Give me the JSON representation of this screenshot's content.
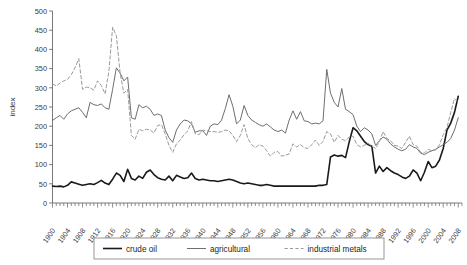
{
  "chart_data": {
    "type": "line",
    "title": "",
    "xlabel": "",
    "ylabel": "index",
    "ylim": [
      0,
      500
    ],
    "xlim": [
      1900,
      2009
    ],
    "ytick_step": 50,
    "yticks": [
      0,
      50,
      100,
      150,
      200,
      250,
      300,
      350,
      400,
      450,
      500
    ],
    "xticks": [
      1900,
      1904,
      1908,
      1912,
      1916,
      1920,
      1924,
      1928,
      1932,
      1936,
      1940,
      1944,
      1948,
      1952,
      1956,
      1960,
      1964,
      1968,
      1972,
      1976,
      1980,
      1984,
      1988,
      1992,
      1996,
      2000,
      2004,
      2008
    ],
    "xtick_minor_step": 1,
    "grid": false,
    "legend_position": "bottom",
    "colors": {
      "crude_oil": "#1a1a1a",
      "agricultural": "#6e6e6e",
      "industrial_metals": "#9a9a9a",
      "axis": "#6b6b6b",
      "background": "#ffffff"
    },
    "x": [
      1900,
      1901,
      1902,
      1903,
      1904,
      1905,
      1906,
      1907,
      1908,
      1909,
      1910,
      1911,
      1912,
      1913,
      1914,
      1915,
      1916,
      1917,
      1918,
      1919,
      1920,
      1921,
      1922,
      1923,
      1924,
      1925,
      1926,
      1927,
      1928,
      1929,
      1930,
      1931,
      1932,
      1933,
      1934,
      1935,
      1936,
      1937,
      1938,
      1939,
      1940,
      1941,
      1942,
      1943,
      1944,
      1945,
      1946,
      1947,
      1948,
      1949,
      1950,
      1951,
      1952,
      1953,
      1954,
      1955,
      1956,
      1957,
      1958,
      1959,
      1960,
      1961,
      1962,
      1963,
      1964,
      1965,
      1966,
      1967,
      1968,
      1969,
      1970,
      1971,
      1972,
      1973,
      1974,
      1975,
      1976,
      1977,
      1978,
      1979,
      1980,
      1981,
      1982,
      1983,
      1984,
      1985,
      1986,
      1987,
      1988,
      1989,
      1990,
      1991,
      1992,
      1993,
      1994,
      1995,
      1996,
      1997,
      1998,
      1999,
      2000,
      2001,
      2002,
      2003,
      2004,
      2005,
      2006,
      2007,
      2008
    ],
    "series": [
      {
        "name": "crude oil",
        "style": "solid",
        "width": 1.6,
        "color": "#1a1a1a",
        "values": [
          44,
          43,
          44,
          42,
          46,
          55,
          52,
          49,
          46,
          48,
          50,
          48,
          53,
          59,
          52,
          48,
          62,
          78,
          72,
          56,
          88,
          64,
          60,
          70,
          64,
          80,
          86,
          74,
          66,
          62,
          60,
          70,
          58,
          72,
          68,
          64,
          66,
          78,
          64,
          60,
          62,
          60,
          58,
          58,
          56,
          58,
          60,
          62,
          60,
          56,
          52,
          50,
          52,
          50,
          48,
          46,
          46,
          48,
          46,
          44,
          44,
          44,
          44,
          44,
          44,
          44,
          44,
          44,
          44,
          44,
          44,
          46,
          46,
          48,
          120,
          125,
          122,
          124,
          118,
          160,
          196,
          188,
          174,
          160,
          152,
          148,
          78,
          96,
          82,
          92,
          84,
          78,
          74,
          68,
          64,
          70,
          86,
          78,
          58,
          80,
          108,
          92,
          96,
          112,
          142,
          190,
          208,
          236,
          278
        ]
      },
      {
        "name": "agricultural",
        "style": "solid",
        "width": 1.0,
        "color": "#6e6e6e",
        "values": [
          215,
          222,
          228,
          218,
          232,
          240,
          244,
          248,
          236,
          222,
          262,
          256,
          254,
          258,
          248,
          244,
          296,
          352,
          338,
          318,
          328,
          222,
          218,
          256,
          248,
          252,
          244,
          228,
          232,
          228,
          190,
          170,
          158,
          190,
          206,
          216,
          214,
          206,
          184,
          188,
          188,
          176,
          200,
          206,
          204,
          216,
          246,
          282,
          252,
          206,
          216,
          254,
          228,
          216,
          210,
          204,
          200,
          206,
          198,
          190,
          186,
          190,
          182,
          216,
          240,
          218,
          238,
          214,
          212,
          206,
          208,
          206,
          214,
          348,
          286,
          262,
          250,
          298,
          244,
          238,
          230,
          200,
          186,
          196,
          190,
          180,
          150,
          162,
          172,
          166,
          154,
          146,
          140,
          136,
          140,
          152,
          146,
          142,
          130,
          126,
          132,
          136,
          140,
          146,
          152,
          158,
          168,
          190,
          222
        ]
      },
      {
        "name": "industrial metals",
        "style": "dashed",
        "width": 1.0,
        "color": "#9a9a9a",
        "values": [
          310,
          305,
          312,
          318,
          322,
          334,
          352,
          376,
          296,
          302,
          300,
          294,
          318,
          306,
          284,
          342,
          458,
          436,
          338,
          286,
          296,
          176,
          166,
          192,
          188,
          192,
          190,
          182,
          202,
          204,
          180,
          150,
          132,
          154,
          164,
          178,
          188,
          212,
          180,
          178,
          190,
          188,
          186,
          186,
          184,
          186,
          190,
          188,
          176,
          160,
          176,
          204,
          168,
          152,
          144,
          152,
          148,
          136,
          122,
          132,
          134,
          122,
          124,
          128,
          154,
          146,
          152,
          144,
          142,
          152,
          164,
          150,
          160,
          186,
          180,
          158,
          176,
          166,
          162,
          172,
          174,
          152,
          146,
          150,
          156,
          148,
          142,
          160,
          186,
          168,
          162,
          150,
          148,
          142,
          158,
          174,
          152,
          148,
          132,
          130,
          140,
          136,
          138,
          152,
          178,
          196,
          236,
          272,
          262
        ]
      }
    ],
    "legend": [
      {
        "label": "crude oil",
        "style": "solid",
        "width": 1.6,
        "color": "#1a1a1a"
      },
      {
        "label": "agricultural",
        "style": "solid",
        "width": 1.0,
        "color": "#6e6e6e"
      },
      {
        "label": "industrial metals",
        "style": "dashed",
        "width": 1.0,
        "color": "#9a9a9a"
      }
    ]
  }
}
